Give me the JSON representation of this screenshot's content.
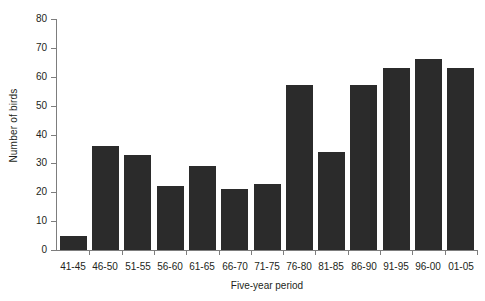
{
  "chart_data": {
    "type": "bar",
    "title": "",
    "xlabel": "Five-year period",
    "ylabel": "Number of birds",
    "categories": [
      "41-45",
      "46-50",
      "51-55",
      "56-60",
      "61-65",
      "66-70",
      "71-75",
      "76-80",
      "81-85",
      "86-90",
      "91-95",
      "96-00",
      "01-05"
    ],
    "values": [
      5,
      36,
      33,
      22,
      29,
      21,
      23,
      57,
      34,
      57,
      63,
      66,
      63
    ],
    "ylim": [
      0,
      80
    ],
    "ytick_labels": [
      "0",
      "10",
      "20",
      "30",
      "40",
      "50",
      "60",
      "70",
      "80"
    ],
    "ytick_values": [
      0,
      10,
      20,
      30,
      40,
      50,
      60,
      70,
      80
    ],
    "grid": false,
    "legend": null,
    "bar_color": "#2b2b2b",
    "axis_color": "#7d7d7d",
    "text_color": "#231f20",
    "background": "#ffffff"
  }
}
